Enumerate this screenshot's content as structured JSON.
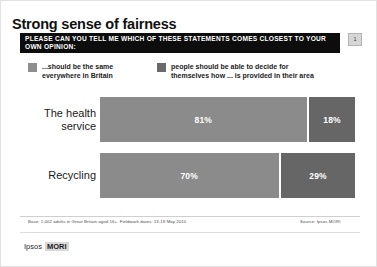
{
  "slide": {
    "title": "Strong sense of fairness",
    "question": "PLEASE CAN YOU TELL ME WHICH OF THESE STATEMENTS COMES CLOSEST TO YOUR OWN OPINION:",
    "badge": "1"
  },
  "legend": {
    "items": [
      {
        "label": "...should be the same\neverywhere in Britain",
        "color": "#8e8e8e",
        "swatch_name": "legend-swatch-same-everywhere"
      },
      {
        "label": "people should be able to decide for\nthemselves how ... is provided in their area",
        "color": "#6a6a6a",
        "swatch_name": "legend-swatch-decide-locally"
      }
    ]
  },
  "footer": {
    "base": "Base: 1,002 adults in Great Britain aged 16+. Fieldwork dates: 13-19 May 2010",
    "source": "Source: Ipsos MORI",
    "logo_text": "Ipsos",
    "logo_mark": "MORI"
  },
  "chart_data": {
    "type": "bar",
    "title": "Strong sense of fairness",
    "orientation": "horizontal",
    "stacked": true,
    "grid": false,
    "legend_position": "top",
    "xlabel": "",
    "ylabel": "",
    "xlim": [
      0,
      100
    ],
    "categories": [
      "The health\nservice",
      "Recycling"
    ],
    "series": [
      {
        "name": "...should be the same everywhere in Britain",
        "color": "#8b8b8b",
        "values": [
          81,
          70
        ],
        "labels": [
          "81%",
          "70%"
        ]
      },
      {
        "name": "people should be able to decide for themselves how ... is provided in their area",
        "color": "#666666",
        "values": [
          18,
          29
        ],
        "labels": [
          "18%",
          "29%"
        ]
      }
    ]
  }
}
